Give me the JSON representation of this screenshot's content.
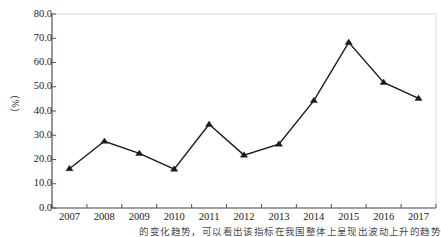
{
  "chart_data": {
    "type": "line",
    "title": "",
    "subtitle": "",
    "xlabel": "",
    "ylabel": "（%）",
    "categories": [
      "2007",
      "2008",
      "2009",
      "2010",
      "2011",
      "2012",
      "2013",
      "2014",
      "2015",
      "2016",
      "2017"
    ],
    "values": [
      16.2,
      27.5,
      22.5,
      16.0,
      34.5,
      21.8,
      26.3,
      44.3,
      68.3,
      51.8,
      45.2
    ],
    "series": [
      {
        "name": "",
        "values": [
          16.2,
          27.5,
          22.5,
          16.0,
          34.5,
          21.8,
          26.3,
          44.3,
          68.3,
          51.8,
          45.2
        ]
      }
    ],
    "ylim": [
      0.0,
      80.0
    ],
    "ytick_step": 10.0,
    "ytick_labels": [
      "0.0",
      "10.0",
      "20.0",
      "30.0",
      "40.0",
      "50.0",
      "60.0",
      "70.0",
      "80.0"
    ],
    "grid": false,
    "legend": false,
    "legend_position": "none",
    "marker": "triangle",
    "line_color": "#1a1a1a",
    "marker_color": "#1a1a1a",
    "plot_border": true,
    "annotations": []
  },
  "axes": {
    "y_label": "（%）",
    "y_ticks": [
      "80.0",
      "70.0",
      "60.0",
      "50.0",
      "40.0",
      "30.0",
      "20.0",
      "10.0",
      "0.0"
    ],
    "x_ticks": [
      "2007",
      "2008",
      "2009",
      "2010",
      "2011",
      "2012",
      "2013",
      "2014",
      "2015",
      "2016",
      "2017"
    ]
  },
  "caption": {
    "text": "的变化趋势，可以看出该指标在我国整体上呈现出波动上升的趋势"
  },
  "colors": {
    "foreground": "#1a1a1a",
    "background": "#ffffff",
    "axis": "#555555",
    "caption": "#4a4a4a"
  }
}
